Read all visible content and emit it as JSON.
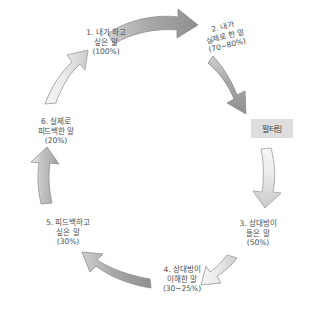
{
  "diagram": {
    "type": "cycle",
    "title": "",
    "nodes": [
      {
        "id": "node-1",
        "index": "1.",
        "line1": "1. 내가 하고",
        "line2": "싶은 말",
        "percent": "(100%)"
      },
      {
        "id": "node-2",
        "index": "2.",
        "line1": "2. 내가",
        "line2": "실제로 한 말",
        "percent": "(70~80%)"
      },
      {
        "id": "node-3",
        "index": "3.",
        "line1": "3. 상대방이",
        "line2": "들은 말",
        "percent": "(50%)"
      },
      {
        "id": "node-4",
        "index": "4.",
        "line1": "4. 상대방이",
        "line2": "이해한 말",
        "percent": "(30~25%)"
      },
      {
        "id": "node-5",
        "index": "5.",
        "line1": "5. 피드백하고",
        "line2": "싶은 말",
        "percent": "(30%)"
      },
      {
        "id": "node-6",
        "index": "6.",
        "line1": "6. 실제로",
        "line2": "피드백한 말",
        "percent": "(20%)"
      }
    ],
    "callout": {
      "label": "필터링",
      "background": "#dedede",
      "text_color": "#3f3f3f"
    },
    "arrows": [
      {
        "name": "arrow-1-to-2",
        "direction": "right",
        "tone": "dark"
      },
      {
        "name": "arrow-2-to-3",
        "direction": "down-right",
        "tone": "dark"
      },
      {
        "name": "arrow-3-filter",
        "direction": "down",
        "tone": "light"
      },
      {
        "name": "arrow-3-to-4",
        "direction": "down-left",
        "tone": "light"
      },
      {
        "name": "arrow-4-to-5",
        "direction": "up-left",
        "tone": "dark"
      },
      {
        "name": "arrow-5-to-6",
        "direction": "up",
        "tone": "mid"
      },
      {
        "name": "arrow-6-to-1",
        "direction": "up-right",
        "tone": "light"
      }
    ],
    "colors": {
      "arrow_dark_fill": "#a5a5a5",
      "arrow_mid_fill": "#bdbdbd",
      "arrow_light_fill": "#dcdcdc",
      "arrow_stroke": "#8d8d8d",
      "text": "#4f4f4f",
      "background": "#ffffff"
    }
  }
}
